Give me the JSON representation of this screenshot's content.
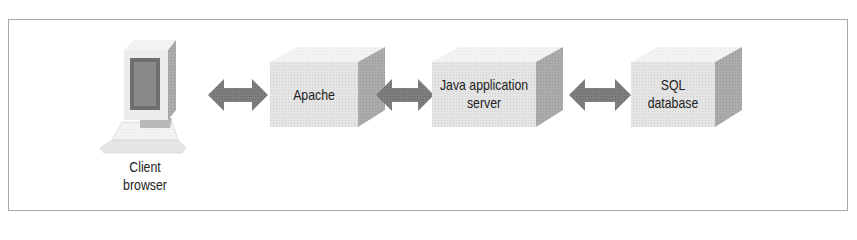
{
  "diagram": {
    "type": "architecture-flow",
    "nodes": [
      {
        "id": "client",
        "label_line1": "Client",
        "label_line2": "browser",
        "icon": "desktop-computer-icon"
      },
      {
        "id": "apache",
        "label_line1": "Apache",
        "label_line2": ""
      },
      {
        "id": "java",
        "label_line1": "Java application",
        "label_line2": "server"
      },
      {
        "id": "sql",
        "label_line1": "SQL",
        "label_line2": "database"
      }
    ],
    "edges": [
      {
        "from": "client",
        "to": "apache",
        "style": "bidirectional-arrow"
      },
      {
        "from": "apache",
        "to": "java",
        "style": "bidirectional-arrow"
      },
      {
        "from": "java",
        "to": "sql",
        "style": "bidirectional-arrow"
      }
    ],
    "colors": {
      "box_front": "#e2e2e2",
      "box_top": "#f0f0f0",
      "box_side": "#a9a9a9",
      "arrow": "#7a7a7a",
      "frame_border": "#a8a8a8",
      "text": "#222222"
    }
  }
}
